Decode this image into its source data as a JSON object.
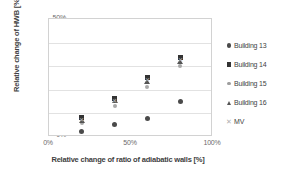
{
  "chart_data": {
    "type": "scatter",
    "title": "",
    "xlabel": "Relative change of ratio of adiabatic walls  [%]",
    "ylabel": "Relative change of HWB [%]",
    "xlim": [
      0,
      125
    ],
    "ylim": [
      0,
      50
    ],
    "xticks": [
      "0%",
      "50%",
      "100%"
    ],
    "xtick_values": [
      0,
      50,
      100
    ],
    "yticks": [
      "0%",
      "10%",
      "20%",
      "30%",
      "40%",
      "50%"
    ],
    "ytick_values": [
      0,
      10,
      20,
      30,
      40,
      50
    ],
    "grid": "horizontal",
    "legend_position": "right",
    "x": [
      25,
      50,
      75,
      100
    ],
    "series": [
      {
        "name": "Building 13",
        "marker": "circle",
        "color": "#4a4a4a",
        "values": [
          2.5,
          5.2,
          7.8,
          15.0
        ]
      },
      {
        "name": "Building 14",
        "marker": "square",
        "color": "#333333",
        "values": [
          8.3,
          16.2,
          25.2,
          33.8
        ]
      },
      {
        "name": "Building 15",
        "marker": "diamond",
        "color": "#a8a8a8",
        "values": [
          6.0,
          13.2,
          21.0,
          30.2
        ]
      },
      {
        "name": "Building 16",
        "marker": "triangle",
        "color": "#545454",
        "values": [
          7.2,
          15.3,
          23.5,
          31.8
        ]
      },
      {
        "name": "MV",
        "marker": "x",
        "color": "#b5b5b5",
        "values": [
          6.8,
          15.0,
          24.0,
          32.5
        ]
      }
    ]
  },
  "legend": {
    "items": [
      {
        "label": "Building 13",
        "marker": "circle-marker"
      },
      {
        "label": "Building 14",
        "marker": "square-marker"
      },
      {
        "label": "Building 15",
        "marker": "diamond-marker"
      },
      {
        "label": "Building 16",
        "marker": "triangle-marker"
      },
      {
        "label": "MV",
        "marker": "x-marker"
      }
    ]
  }
}
